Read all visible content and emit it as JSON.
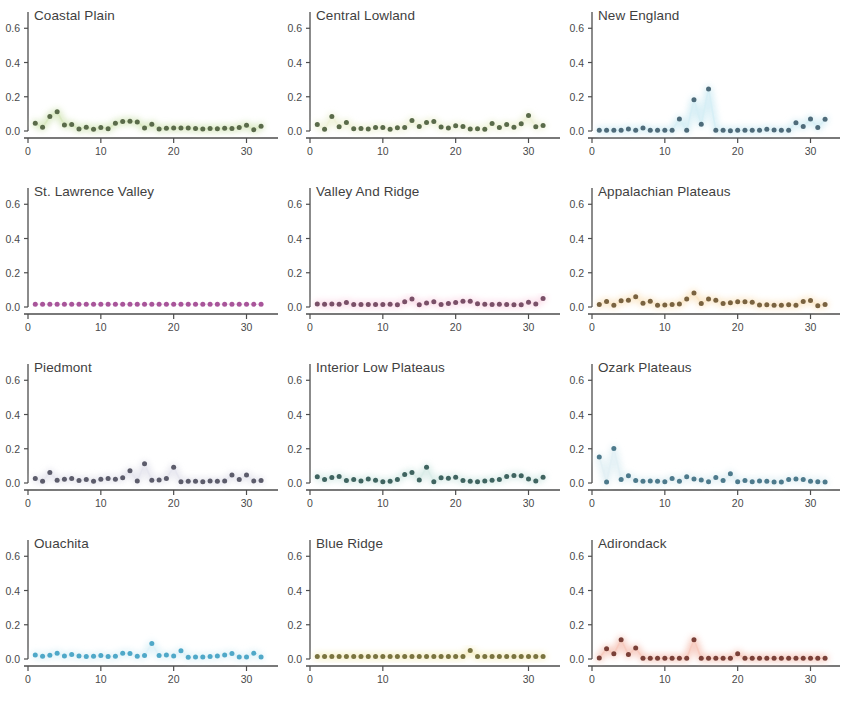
{
  "figure": {
    "type": "small-multiples-scatter",
    "rows": 4,
    "cols": 3,
    "background": "#ffffff"
  },
  "axes": {
    "y_ticks": [
      "0.0",
      "0.2",
      "0.4",
      "0.6"
    ],
    "y_tick_values": [
      0.0,
      0.2,
      0.4,
      0.6
    ],
    "ylim": [
      0.0,
      0.66
    ],
    "x_ticks": [
      "0",
      "10",
      "20",
      "30"
    ],
    "x_tick_values": [
      0,
      10,
      20,
      30
    ],
    "xlim": [
      0,
      33.5
    ],
    "grid": false,
    "xlabel": "",
    "ylabel": ""
  },
  "chart_data": {
    "type": "scatter",
    "title": "",
    "xlabel": "",
    "ylabel": "",
    "xlim": [
      0,
      33.5
    ],
    "ylim": [
      0.0,
      0.66
    ],
    "x_ticks": [
      0,
      10,
      20,
      30
    ],
    "y_ticks": [
      0.0,
      0.2,
      0.4,
      0.6
    ],
    "grid": false,
    "legend": "none",
    "shared_x": [
      1,
      2,
      3,
      4,
      5,
      6,
      7,
      8,
      9,
      10,
      11,
      12,
      13,
      14,
      15,
      16,
      17,
      18,
      19,
      20,
      21,
      22,
      23,
      24,
      25,
      26,
      27,
      28,
      29,
      30,
      31,
      32
    ],
    "panels": [
      {
        "name": "Coastal Plain",
        "dot_color": "#5a6b4a",
        "glow_color": "#d8e8c0",
        "x_ticks_shown": [
          "0",
          "10",
          "20",
          "30"
        ],
        "values": [
          0.045,
          0.022,
          0.085,
          0.112,
          0.035,
          0.038,
          0.012,
          0.022,
          0.01,
          0.02,
          0.013,
          0.045,
          0.055,
          0.057,
          0.053,
          0.018,
          0.04,
          0.012,
          0.016,
          0.017,
          0.018,
          0.017,
          0.015,
          0.012,
          0.014,
          0.013,
          0.016,
          0.014,
          0.02,
          0.033,
          0.008,
          0.028
        ]
      },
      {
        "name": "Central Lowland",
        "dot_color": "#5a6b4a",
        "glow_color": "#eef2d8",
        "x_ticks_shown": [
          "0",
          "10",
          "20",
          "30"
        ],
        "values": [
          0.038,
          0.01,
          0.085,
          0.025,
          0.05,
          0.013,
          0.014,
          0.012,
          0.02,
          0.021,
          0.01,
          0.019,
          0.02,
          0.062,
          0.026,
          0.05,
          0.055,
          0.023,
          0.018,
          0.031,
          0.026,
          0.012,
          0.013,
          0.01,
          0.044,
          0.02,
          0.038,
          0.022,
          0.042,
          0.09,
          0.025,
          0.032
        ]
      },
      {
        "name": "New England",
        "dot_color": "#4e6b7a",
        "glow_color": "#d6eef5",
        "x_ticks_shown": [
          "0",
          "10",
          "20",
          "30"
        ],
        "values": [
          0.004,
          0.004,
          0.004,
          0.004,
          0.012,
          0.004,
          0.017,
          0.004,
          0.004,
          0.004,
          0.004,
          0.07,
          0.004,
          0.182,
          0.04,
          0.245,
          0.004,
          0.004,
          0.002,
          0.004,
          0.004,
          0.004,
          0.004,
          0.01,
          0.006,
          0.004,
          0.004,
          0.048,
          0.026,
          0.07,
          0.02,
          0.068
        ]
      },
      {
        "name": "St. Lawrence Valley",
        "dot_color": "#a8559a",
        "glow_color": "#f6e4f2",
        "x_ticks_shown": [
          "0",
          "10",
          "20",
          "30"
        ],
        "values": [
          0.016,
          0.016,
          0.016,
          0.016,
          0.016,
          0.016,
          0.016,
          0.016,
          0.016,
          0.016,
          0.016,
          0.016,
          0.016,
          0.016,
          0.016,
          0.016,
          0.016,
          0.016,
          0.016,
          0.016,
          0.016,
          0.016,
          0.016,
          0.016,
          0.016,
          0.016,
          0.016,
          0.016,
          0.016,
          0.016,
          0.016,
          0.016
        ]
      },
      {
        "name": "Valley And Ridge",
        "dot_color": "#7a5068",
        "glow_color": "#fbdde9",
        "x_ticks_shown": [
          "0",
          "10",
          "20",
          "30"
        ],
        "values": [
          0.018,
          0.016,
          0.018,
          0.016,
          0.026,
          0.014,
          0.015,
          0.015,
          0.014,
          0.015,
          0.016,
          0.013,
          0.03,
          0.046,
          0.013,
          0.023,
          0.03,
          0.015,
          0.02,
          0.026,
          0.033,
          0.034,
          0.019,
          0.016,
          0.014,
          0.016,
          0.014,
          0.013,
          0.013,
          0.028,
          0.018,
          0.05
        ]
      },
      {
        "name": "Appalachian Plateaus",
        "dot_color": "#7a6340",
        "glow_color": "#fbe7c8",
        "x_ticks_shown": [
          "0",
          "10",
          "20",
          "30"
        ],
        "values": [
          0.015,
          0.032,
          0.01,
          0.036,
          0.04,
          0.06,
          0.022,
          0.034,
          0.01,
          0.012,
          0.014,
          0.018,
          0.046,
          0.082,
          0.02,
          0.046,
          0.04,
          0.02,
          0.025,
          0.03,
          0.03,
          0.028,
          0.012,
          0.013,
          0.01,
          0.01,
          0.013,
          0.01,
          0.032,
          0.038,
          0.008,
          0.015
        ]
      },
      {
        "name": "Piedmont",
        "dot_color": "#5c5c6b",
        "glow_color": "#e6e6ee",
        "x_ticks_shown": [
          "0",
          "10",
          "20",
          "30"
        ],
        "values": [
          0.026,
          0.01,
          0.062,
          0.016,
          0.022,
          0.026,
          0.014,
          0.02,
          0.01,
          0.022,
          0.026,
          0.022,
          0.03,
          0.072,
          0.012,
          0.112,
          0.016,
          0.018,
          0.026,
          0.092,
          0.008,
          0.01,
          0.01,
          0.008,
          0.012,
          0.01,
          0.012,
          0.046,
          0.02,
          0.046,
          0.012,
          0.014
        ]
      },
      {
        "name": "Interior Low Plateaus",
        "dot_color": "#3f6460",
        "glow_color": "#d9ece8",
        "x_ticks_shown": [
          "0",
          "10",
          "20",
          "30"
        ],
        "values": [
          0.036,
          0.02,
          0.032,
          0.038,
          0.014,
          0.02,
          0.012,
          0.024,
          0.016,
          0.008,
          0.01,
          0.02,
          0.05,
          0.062,
          0.018,
          0.092,
          0.008,
          0.03,
          0.028,
          0.034,
          0.014,
          0.01,
          0.008,
          0.012,
          0.016,
          0.02,
          0.038,
          0.044,
          0.042,
          0.024,
          0.012,
          0.034
        ]
      },
      {
        "name": "Ozark Plateaus",
        "dot_color": "#4d7a8c",
        "glow_color": "#e2f0f4",
        "x_ticks_shown": [
          "0",
          "10",
          "20",
          "30"
        ],
        "values": [
          0.152,
          0.006,
          0.202,
          0.02,
          0.042,
          0.014,
          0.01,
          0.012,
          0.01,
          0.008,
          0.026,
          0.01,
          0.036,
          0.024,
          0.018,
          0.008,
          0.032,
          0.014,
          0.054,
          0.008,
          0.014,
          0.008,
          0.012,
          0.01,
          0.006,
          0.006,
          0.02,
          0.024,
          0.02,
          0.01,
          0.008,
          0.006
        ]
      },
      {
        "name": "Ouachita",
        "dot_color": "#4fa8c8",
        "glow_color": "#dff2f8",
        "x_ticks_shown": [
          "0",
          "10",
          "20",
          "30"
        ],
        "values": [
          0.024,
          0.016,
          0.022,
          0.034,
          0.018,
          0.026,
          0.018,
          0.014,
          0.016,
          0.02,
          0.014,
          0.016,
          0.034,
          0.032,
          0.016,
          0.02,
          0.09,
          0.02,
          0.024,
          0.018,
          0.048,
          0.01,
          0.012,
          0.012,
          0.014,
          0.018,
          0.024,
          0.032,
          0.012,
          0.012,
          0.034,
          0.012
        ]
      },
      {
        "name": "Blue Ridge",
        "dot_color": "#7a7440",
        "glow_color": "#f7f0c8",
        "x_ticks_shown": [
          "0",
          "10",
          "30"
        ],
        "values": [
          0.014,
          0.014,
          0.014,
          0.014,
          0.014,
          0.014,
          0.014,
          0.014,
          0.014,
          0.014,
          0.014,
          0.014,
          0.014,
          0.014,
          0.014,
          0.014,
          0.014,
          0.014,
          0.014,
          0.014,
          0.014,
          0.05,
          0.014,
          0.014,
          0.014,
          0.014,
          0.014,
          0.014,
          0.014,
          0.014,
          0.014,
          0.014
        ]
      },
      {
        "name": "Adirondack",
        "dot_color": "#7a4038",
        "glow_color": "#f6c9bd",
        "x_ticks_shown": [
          "0",
          "10",
          "20",
          "30"
        ],
        "values": [
          0.006,
          0.06,
          0.03,
          0.112,
          0.026,
          0.064,
          0.004,
          0.004,
          0.004,
          0.004,
          0.004,
          0.004,
          0.004,
          0.112,
          0.004,
          0.004,
          0.004,
          0.004,
          0.004,
          0.03,
          0.004,
          0.004,
          0.004,
          0.004,
          0.004,
          0.004,
          0.004,
          0.004,
          0.004,
          0.004,
          0.004,
          0.004
        ]
      }
    ]
  }
}
